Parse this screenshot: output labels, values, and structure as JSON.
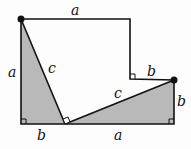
{
  "diagram": {
    "colors": {
      "fill": "#b9b9b9",
      "stroke": "#111111",
      "background": "#fdfdfd"
    },
    "labels": {
      "top": "a",
      "left": "a",
      "hyp_left": "c",
      "step": "b",
      "hyp_right": "c",
      "right": "b",
      "bottom_left": "b",
      "bottom_right": "a"
    }
  }
}
